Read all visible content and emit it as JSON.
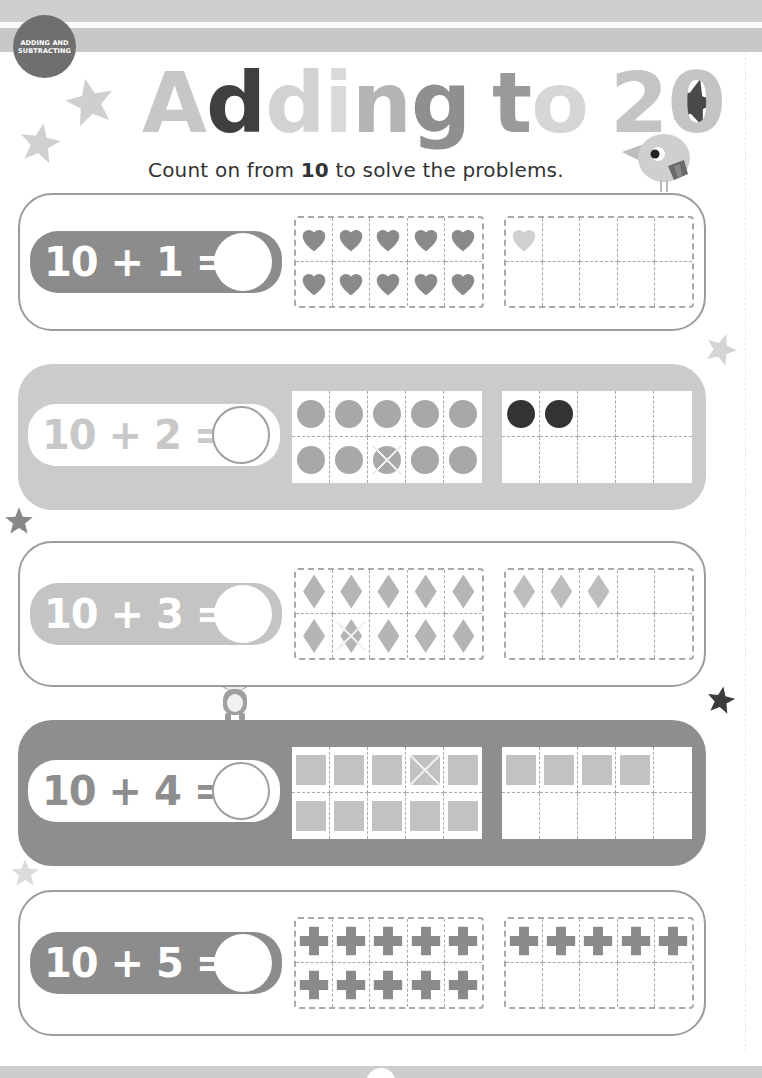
{
  "header": {
    "badge_line1": "ADDING AND",
    "badge_line2": "SUBTRACTING"
  },
  "title": {
    "letters": [
      {
        "char": "A",
        "color": "#c7c7c7"
      },
      {
        "char": "d",
        "color": "#3f3f3f"
      },
      {
        "char": "d",
        "color": "#d2d2d2"
      },
      {
        "char": "i",
        "color": "#d9d9d9"
      },
      {
        "char": "n",
        "color": "#b4b4b4"
      },
      {
        "char": "g",
        "color": "#8f8f8f"
      },
      {
        "char": " ",
        "color": "#fff"
      },
      {
        "char": "t",
        "color": "#9a9a9a"
      },
      {
        "char": "o",
        "color": "#d6d6d6"
      },
      {
        "char": " ",
        "color": "#fff"
      },
      {
        "char": "2",
        "color": "#c4c4c4"
      },
      {
        "char": "0",
        "color": "#c4c4c4"
      }
    ],
    "text": "Adding to 20"
  },
  "instructions": {
    "prefix": "Count on from ",
    "bold": "10",
    "suffix": " to solve the problems."
  },
  "problems": [
    {
      "equation": "10 + 1 =",
      "answer": "",
      "shape": "heart",
      "first_frame_count": 10,
      "second_frame_count": 1,
      "first_color": "#8a8a8a",
      "second_color": "#d0d0d0",
      "crossed_index": null
    },
    {
      "equation": "10 + 2 =",
      "answer": "",
      "shape": "dot",
      "first_frame_count": 10,
      "second_frame_count": 2,
      "first_color": "#a8a8a8",
      "second_color": "#333333",
      "crossed_index": 7
    },
    {
      "equation": "10 + 3 =",
      "answer": "",
      "shape": "diamond",
      "first_frame_count": 10,
      "second_frame_count": 3,
      "first_color": "#b5b5b5",
      "second_color": "#bdbdbd",
      "crossed_index": 6
    },
    {
      "equation": "10 + 4 =",
      "answer": "",
      "shape": "square",
      "first_frame_count": 10,
      "second_frame_count": 4,
      "first_color": "#c2c2c2",
      "second_color": "#c2c2c2",
      "crossed_index": 3
    },
    {
      "equation": "10 + 5 =",
      "answer": "",
      "shape": "plus",
      "first_frame_count": 10,
      "second_frame_count": 5,
      "first_color": "#8a8a8a",
      "second_color": "#8a8a8a",
      "crossed_index": null
    }
  ],
  "decorations": {
    "icons": [
      "star-icon",
      "bird-icon",
      "hamster-icon"
    ]
  }
}
